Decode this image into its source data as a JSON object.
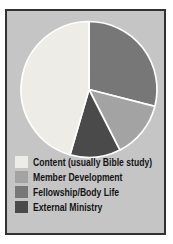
{
  "card": {
    "page_background": "#ffffff",
    "background_color": "#c5c5c5",
    "border_color": "#323232"
  },
  "chart_data": {
    "type": "pie",
    "title": "",
    "slices": [
      {
        "label": "Content (usually Bible study)",
        "value": 45.5,
        "color": "#edece6"
      },
      {
        "label": "Member Development",
        "value": 13.5,
        "color": "#a3a3a3"
      },
      {
        "label": "Fellowship/Body Life",
        "value": 29,
        "color": "#777777"
      },
      {
        "label": "External Ministry",
        "value": 12,
        "color": "#4a4a4a"
      }
    ],
    "values_unit": "percent (estimated from slice angles)",
    "start_angle_deg_from_top": 0,
    "direction": "clockwise",
    "clockwise_order_from_top": [
      2,
      1,
      3,
      0
    ],
    "divider_color": "#ffffff",
    "legend_position": "bottom-left",
    "legend_text_color": "#141414"
  }
}
